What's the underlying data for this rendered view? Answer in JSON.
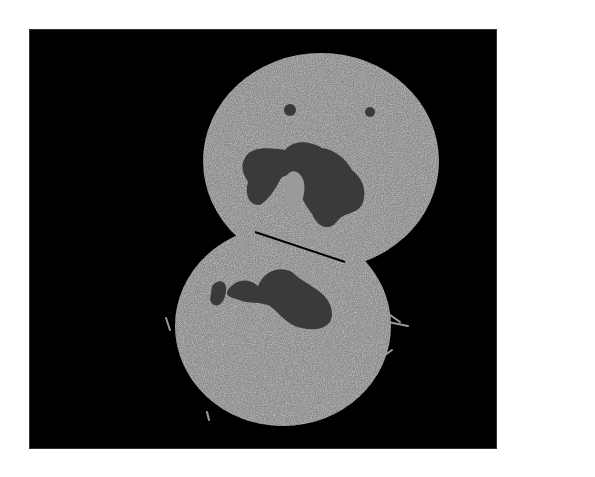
{
  "figure": {
    "type": "micrograph",
    "background_color": "#ffffff",
    "panel_color": "#000000",
    "panel": {
      "x": 29,
      "y": 29,
      "width": 468,
      "height": 420
    },
    "cell_texture_color": "#9a9a9a",
    "cell_highlight_color": "#d8d8d8",
    "nucleus_color": "#3a3a3a",
    "cells": [
      {
        "name": "upper-cell",
        "cx": 321,
        "cy": 161,
        "rx": 118,
        "ry": 108
      },
      {
        "name": "lower-cell",
        "cx": 283,
        "cy": 326,
        "rx": 108,
        "ry": 100
      }
    ]
  }
}
